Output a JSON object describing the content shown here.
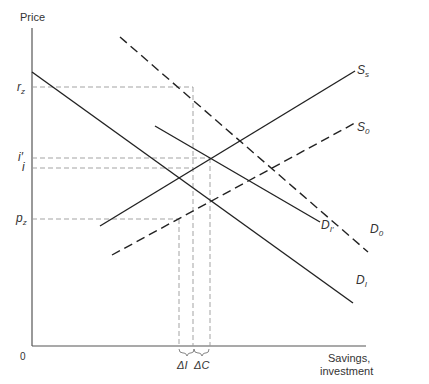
{
  "diagram": {
    "y_axis_label": "Price",
    "x_axis_label_line1": "Savings,",
    "x_axis_label_line2": "investment",
    "origin_label": "0",
    "price_levels": [
      {
        "id": "rz",
        "label": "r",
        "sub": "z"
      },
      {
        "id": "iprime",
        "label": "i′",
        "sub": ""
      },
      {
        "id": "i",
        "label": "i",
        "sub": ""
      },
      {
        "id": "pz",
        "label": "p",
        "sub": "z"
      }
    ],
    "curves": [
      {
        "id": "DI",
        "label": "D",
        "sub": "I",
        "style": "solid"
      },
      {
        "id": "DIprime",
        "label": "D",
        "sub": "I′",
        "style": "solid"
      },
      {
        "id": "Ss",
        "label": "S",
        "sub": "s",
        "style": "solid"
      },
      {
        "id": "S0",
        "label": "S",
        "sub": "0",
        "style": "dashed"
      },
      {
        "id": "D0",
        "label": "D",
        "sub": "0",
        "style": "dashed"
      }
    ],
    "brace_labels": {
      "delta_i": "ΔI",
      "delta_c": "ΔC"
    },
    "colors": {
      "line": "#222222",
      "guide": "#999999",
      "axis": "#555555"
    }
  }
}
